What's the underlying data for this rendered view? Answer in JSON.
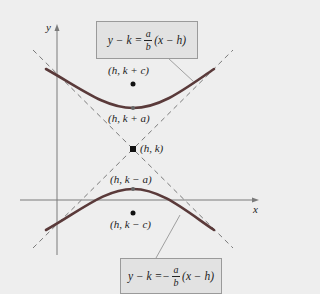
{
  "diagram": {
    "axes": {
      "x_label": "x",
      "y_label": "y"
    },
    "points": [
      {
        "id": "focus-top",
        "label": "(h, k + c)"
      },
      {
        "id": "vertex-top",
        "label": "(h, k + a)"
      },
      {
        "id": "center",
        "label": "(h, k)"
      },
      {
        "id": "vertex-bottom",
        "label": "(h, k − a)"
      },
      {
        "id": "focus-bottom",
        "label": "(h, k − c)"
      }
    ],
    "asymptotes": [
      {
        "id": "positive",
        "lhs": "y − k = ",
        "sign": "",
        "num": "a",
        "den": "b",
        "rhs": "(x − h)"
      },
      {
        "id": "negative",
        "lhs": "y − k = ",
        "sign": "−",
        "num": "a",
        "den": "b",
        "rhs": "(x − h)"
      }
    ],
    "colors": {
      "curve": "#5a3a3a",
      "asymptote": "#777777",
      "axis": "#777777",
      "background": "#eeeeee",
      "box": "#e2e2e2"
    }
  }
}
